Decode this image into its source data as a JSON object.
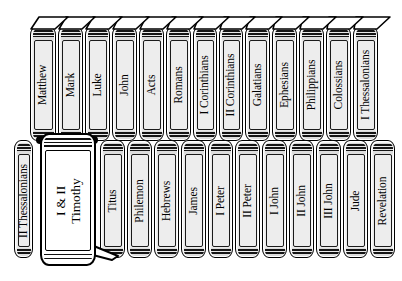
{
  "figure": {
    "kind": "bookshelf-illustration",
    "colors": {
      "spine_fill": "#e9e9e9",
      "panel_fill": "#ededed",
      "highlight_fill": "#ffffff",
      "outline": "#000000",
      "background": "#ffffff"
    }
  },
  "shelf": {
    "top_row": [
      {
        "title": "Matthew",
        "x": 30,
        "width": 26,
        "lean": 7
      },
      {
        "title": "Mark",
        "x": 58,
        "width": 25,
        "lean": 6
      },
      {
        "title": "Luke",
        "x": 85,
        "width": 25,
        "lean": 6
      },
      {
        "title": "John",
        "x": 112,
        "width": 25,
        "lean": 5
      },
      {
        "title": "Acts",
        "x": 139,
        "width": 25,
        "lean": 5
      },
      {
        "title": "Romans",
        "x": 166,
        "width": 25,
        "lean": 4
      },
      {
        "title": "I Corinthians",
        "x": 193,
        "width": 24,
        "lean": 4
      },
      {
        "title": "II Corinthians",
        "x": 219,
        "width": 24,
        "lean": 3
      },
      {
        "title": "Galatians",
        "x": 245,
        "width": 25,
        "lean": 3
      },
      {
        "title": "Ephesians",
        "x": 272,
        "width": 25,
        "lean": 2
      },
      {
        "title": "Philippians",
        "x": 299,
        "width": 25,
        "lean": 2
      },
      {
        "title": "Colossians",
        "x": 326,
        "width": 25,
        "lean": 1
      },
      {
        "title": "I Thessalonians",
        "x": 353,
        "width": 25,
        "lean": 1
      }
    ],
    "bottom_row": [
      {
        "title": "II Thessalonians",
        "x": 14,
        "width": 19,
        "highlight": false
      },
      {
        "title": "I & II\nTimothy",
        "x": 40,
        "width": 56,
        "highlight": true
      },
      {
        "title": "Titus",
        "x": 100,
        "width": 25,
        "highlight": false
      },
      {
        "title": "Philemon",
        "x": 127,
        "width": 25,
        "highlight": false
      },
      {
        "title": "Hebrews",
        "x": 154,
        "width": 25,
        "highlight": false
      },
      {
        "title": "James",
        "x": 181,
        "width": 25,
        "highlight": false
      },
      {
        "title": "I Peter",
        "x": 208,
        "width": 25,
        "highlight": false
      },
      {
        "title": "II Peter",
        "x": 235,
        "width": 25,
        "highlight": false
      },
      {
        "title": "I John",
        "x": 262,
        "width": 25,
        "highlight": false
      },
      {
        "title": "II John",
        "x": 289,
        "width": 25,
        "highlight": false
      },
      {
        "title": "III John",
        "x": 316,
        "width": 25,
        "highlight": false
      },
      {
        "title": "Jude",
        "x": 343,
        "width": 25,
        "highlight": false
      },
      {
        "title": "Revelation",
        "x": 370,
        "width": 25,
        "highlight": false
      }
    ]
  },
  "geometry": {
    "top_row_y": 26,
    "top_row_height": 115,
    "bottom_row_y": 140,
    "bottom_row_height": 118,
    "highlight_y": 133,
    "highlight_height": 133
  }
}
